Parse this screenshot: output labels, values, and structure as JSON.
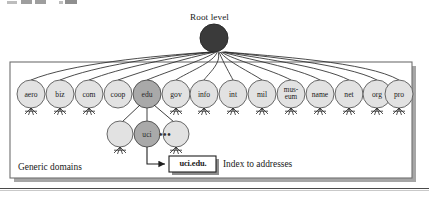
{
  "figure": {
    "type": "tree-diagram",
    "root": {
      "caption": "Root level",
      "fill": "#3a3a3a"
    },
    "frame": {
      "caption": "Generic domains"
    },
    "generic_domains": [
      {
        "label": "aero",
        "highlight": false
      },
      {
        "label": "biz",
        "highlight": false
      },
      {
        "label": "com",
        "highlight": false
      },
      {
        "label": "coop",
        "highlight": false
      },
      {
        "label": "edu",
        "highlight": true
      },
      {
        "label": "gov",
        "highlight": false
      },
      {
        "label": "info",
        "highlight": false
      },
      {
        "label": "int",
        "highlight": false
      },
      {
        "label": "mil",
        "highlight": false
      },
      {
        "label": "mus-\neum",
        "highlight": false
      },
      {
        "label": "name",
        "highlight": false
      },
      {
        "label": "net",
        "highlight": false
      },
      {
        "label": "org",
        "highlight": false
      },
      {
        "label": "pro",
        "highlight": false
      }
    ],
    "second_level": [
      {
        "label": "",
        "highlight": false
      },
      {
        "label": "uci",
        "highlight": true
      },
      {
        "label": "",
        "highlight": false
      }
    ],
    "ellipsis": "•••",
    "callout": {
      "box_label": "uci.edu.",
      "description": "Index to addresses"
    },
    "colors": {
      "root_fill": "#3a3a3a",
      "node_fill": "#e0e0e0",
      "node_highlight_fill": "#a8a8a8",
      "node_stroke": "#555555",
      "frame_stroke": "#707070",
      "shadow": "#9a9a9a",
      "line": "#2a2a2a"
    }
  }
}
